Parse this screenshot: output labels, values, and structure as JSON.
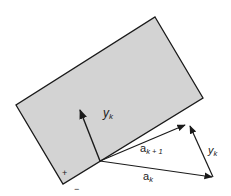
{
  "diagram": {
    "title": "",
    "colors": {
      "background": "#ffffff",
      "rectangle_fill": "#d3d3d3",
      "stroke": "#1a1a1a",
      "text": "#222222"
    },
    "rectangle": {
      "corners": [
        [
          155,
          17
        ],
        [
          203,
          98
        ],
        [
          63,
          184
        ],
        [
          16,
          105
        ]
      ]
    },
    "vectors": [
      {
        "name": "y_k (normal)",
        "from": [
          100,
          161
        ],
        "to": [
          79,
          108
        ]
      },
      {
        "name": "a_k+1",
        "from": [
          100,
          161
        ],
        "to": [
          186,
          124
        ]
      },
      {
        "name": "a_k",
        "from": [
          100,
          161
        ],
        "to": [
          213,
          177
        ]
      },
      {
        "name": "y_k (difference)",
        "from": [
          213,
          177
        ],
        "to": [
          190,
          124
        ]
      }
    ],
    "labels": {
      "yk_inside_base": "y",
      "yk_inside_sub": "k",
      "ak1_base": "a",
      "ak1_sub": "k + 1",
      "ak_base": "a",
      "ak_sub": "k",
      "yk_right_base": "y",
      "yk_right_sub": "k",
      "plus_sign": "+",
      "minus_sign": "−"
    }
  }
}
